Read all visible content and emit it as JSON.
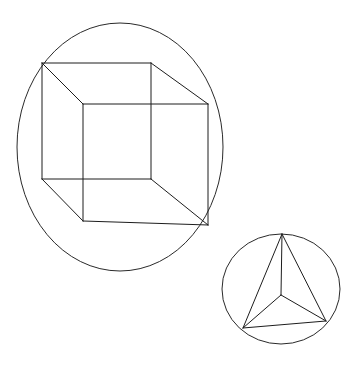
{
  "canvas": {
    "width": 364,
    "height": 368,
    "background": "#ffffff",
    "title": "Geometric line drawing: wireframe cube in ellipse and tetrahedron in circle"
  },
  "style": {
    "stroke_color": "#1d1d1d",
    "outline_color": "#2a2a2a",
    "stroke_width": 1,
    "fill": "none"
  },
  "figures": [
    {
      "id": "cube-figure",
      "name": "wireframe-cube-in-ellipse",
      "label": "Cube inscribed in ellipse",
      "outline": {
        "shape": "ellipse",
        "cx": 120,
        "cy": 147,
        "rx": 103,
        "ry": 124
      },
      "vertices": {
        "back_top_left": {
          "x": 42,
          "y": 63
        },
        "back_top_right": {
          "x": 151,
          "y": 63
        },
        "back_bottom_right": {
          "x": 151,
          "y": 179
        },
        "back_bottom_left": {
          "x": 42,
          "y": 179
        },
        "front_top_left": {
          "x": 83,
          "y": 104
        },
        "front_top_right": {
          "x": 208,
          "y": 104
        },
        "front_bottom_right": {
          "x": 208,
          "y": 225
        },
        "front_bottom_left": {
          "x": 83,
          "y": 221
        }
      },
      "edges": [
        {
          "name": "back-top",
          "from": "back_top_left",
          "to": "back_top_right"
        },
        {
          "name": "back-right",
          "from": "back_top_right",
          "to": "back_bottom_right"
        },
        {
          "name": "back-bottom",
          "from": "back_bottom_right",
          "to": "back_bottom_left"
        },
        {
          "name": "back-left",
          "from": "back_bottom_left",
          "to": "back_top_left"
        },
        {
          "name": "front-top",
          "from": "front_top_left",
          "to": "front_top_right"
        },
        {
          "name": "front-right",
          "from": "front_top_right",
          "to": "front_bottom_right"
        },
        {
          "name": "front-bottom",
          "from": "front_bottom_right",
          "to": "front_bottom_left"
        },
        {
          "name": "front-left",
          "from": "front_bottom_left",
          "to": "front_top_left"
        },
        {
          "name": "connector-top-left",
          "from": "back_top_left",
          "to": "front_top_left"
        },
        {
          "name": "connector-top-right",
          "from": "back_top_right",
          "to": "front_top_right"
        },
        {
          "name": "connector-bottom-right",
          "from": "back_bottom_right",
          "to": "front_bottom_right"
        },
        {
          "name": "connector-bottom-left",
          "from": "back_bottom_left",
          "to": "front_bottom_left"
        }
      ]
    },
    {
      "id": "tetrahedron-figure",
      "name": "wireframe-tetrahedron-in-circle",
      "label": "Tetrahedron inscribed in circle",
      "outline": {
        "shape": "ellipse",
        "cx": 281,
        "cy": 289,
        "rx": 59,
        "ry": 55
      },
      "vertices": {
        "apex": {
          "x": 282,
          "y": 234
        },
        "bottom_left": {
          "x": 243,
          "y": 328
        },
        "bottom_right": {
          "x": 326,
          "y": 321
        },
        "center": {
          "x": 281,
          "y": 295
        }
      },
      "edges": [
        {
          "name": "outer-left",
          "from": "apex",
          "to": "bottom_left"
        },
        {
          "name": "outer-right",
          "from": "apex",
          "to": "bottom_right"
        },
        {
          "name": "outer-base",
          "from": "bottom_left",
          "to": "bottom_right"
        },
        {
          "name": "spoke-apex",
          "from": "center",
          "to": "apex"
        },
        {
          "name": "spoke-bottom-left",
          "from": "center",
          "to": "bottom_left"
        },
        {
          "name": "spoke-bottom-right",
          "from": "center",
          "to": "bottom_right"
        }
      ]
    }
  ]
}
